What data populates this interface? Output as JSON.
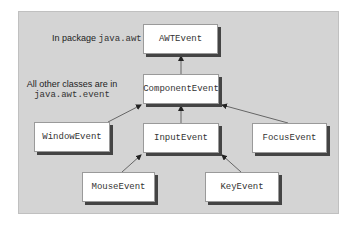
{
  "diagram": {
    "notes": {
      "awt_prefix": "In package ",
      "awt_pkg": "java.awt",
      "event_line1": "All other classes are in",
      "event_pkg": "java.awt.event"
    },
    "nodes": {
      "awt_event": "AWTEvent",
      "component_event": "ComponentEvent",
      "window_event": "WindowEvent",
      "input_event": "InputEvent",
      "focus_event": "FocusEvent",
      "mouse_event": "MouseEvent",
      "key_event": "KeyEvent"
    },
    "edges": [
      {
        "from": "ComponentEvent",
        "to": "AWTEvent"
      },
      {
        "from": "WindowEvent",
        "to": "ComponentEvent"
      },
      {
        "from": "InputEvent",
        "to": "ComponentEvent"
      },
      {
        "from": "FocusEvent",
        "to": "ComponentEvent"
      },
      {
        "from": "MouseEvent",
        "to": "InputEvent"
      },
      {
        "from": "KeyEvent",
        "to": "InputEvent"
      }
    ],
    "colors": {
      "panel": "#d4d4d4",
      "box": "#ffffff",
      "shadow": "#444444",
      "line": "#555555"
    }
  }
}
